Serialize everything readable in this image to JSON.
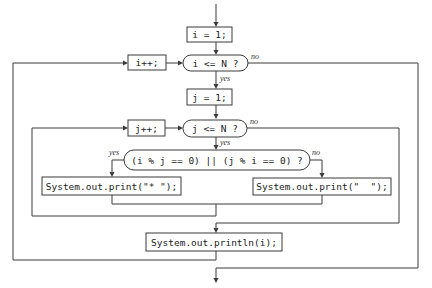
{
  "diagram": {
    "type": "flowchart",
    "colors": {
      "line": "#3a3a3a",
      "text": "#222222",
      "background": "#ffffff"
    },
    "nodes": {
      "init_i": {
        "shape": "process",
        "text": "i = 1;"
      },
      "cond_i": {
        "shape": "decision",
        "text": "i <= N ?"
      },
      "incr_i": {
        "shape": "process",
        "text": "i++;"
      },
      "init_j": {
        "shape": "process",
        "text": "j = 1;"
      },
      "cond_j": {
        "shape": "decision",
        "text": "j <= N ?"
      },
      "incr_j": {
        "shape": "process",
        "text": "j++;"
      },
      "cond_div": {
        "shape": "decision",
        "text": "(i % j == 0) || (j % i == 0) ?"
      },
      "print_star": {
        "shape": "process",
        "text": "System.out.print(\"* \");"
      },
      "print_space": {
        "shape": "process",
        "text": "System.out.print(\"  \");"
      },
      "println_i": {
        "shape": "process",
        "text": "System.out.println(i);"
      }
    },
    "labels": {
      "cond_i_yes": "yes",
      "cond_i_no": "no",
      "cond_j_yes": "yes",
      "cond_j_no": "no",
      "cond_div_yes": "yes",
      "cond_div_no": "no"
    }
  }
}
